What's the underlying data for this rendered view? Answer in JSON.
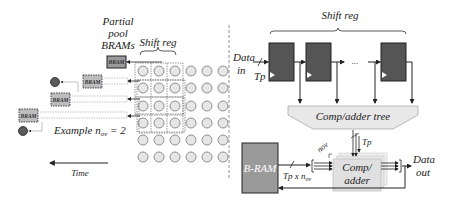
{
  "left_panel": {
    "title_partial_pool": [
      "Partial",
      "pool",
      "BRAMs"
    ],
    "shift_reg_label": "Shift reg",
    "bram_label": "BRAM",
    "example_label": "Example n",
    "example_sub": "ov",
    "example_value": " = 2",
    "time_label": "Time",
    "grid": {
      "rows": 6,
      "cols": 6,
      "highlight_cols": 3,
      "highlight_rows": 4
    }
  },
  "right_panel": {
    "shift_reg_label": "Shift reg",
    "data_in_label": [
      "Data",
      "in"
    ],
    "tp_label": "Tp",
    "ellipsis": "...",
    "comp_adder_tree_label": "Comp/adder tree",
    "bram_label": "B-RAM",
    "bus_label": "Tp x n",
    "bus_sub": "ov",
    "nov_label": "nov",
    "tp_top_label": "Tp",
    "comp_adder_label": [
      "Comp/",
      "adder"
    ],
    "data_out_label": [
      "Data",
      "out"
    ]
  },
  "colors": {
    "register_fill": "#555555",
    "bram_fill": "#9a9a9a",
    "small_bram_fill": "#bdbdbd",
    "circle_fill": "#e6e6e6",
    "dark_dot": "#5a5a5a",
    "tree_fill": "#e8e8e8",
    "comp_fill": "#e0e0e0",
    "line": "#222222"
  }
}
